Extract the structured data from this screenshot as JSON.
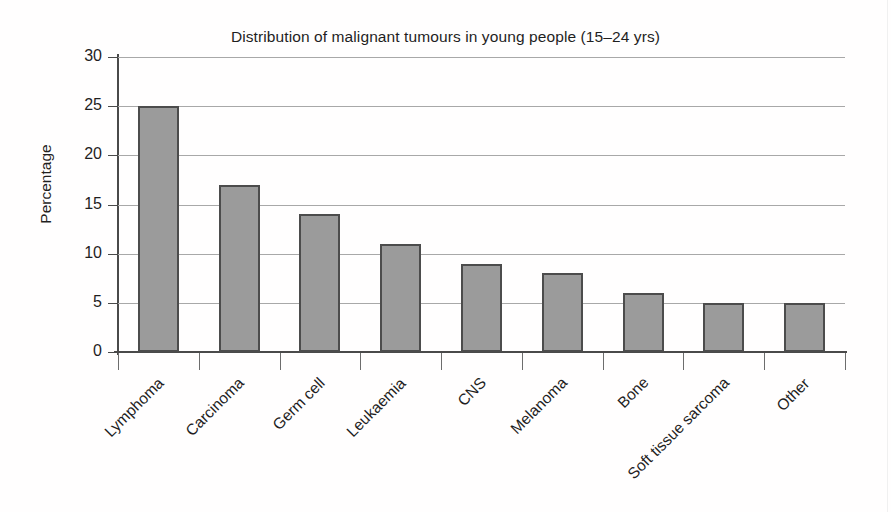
{
  "chart_data": {
    "type": "bar",
    "title": "Distribution of malignant tumours in young people (15–24 yrs)",
    "xlabel": "",
    "ylabel": "Percentage",
    "categories": [
      "Lymphoma",
      "Carcinoma",
      "Germ cell",
      "Leukaemia",
      "CNS",
      "Melanoma",
      "Bone",
      "Soft tissue sarcoma",
      "Other"
    ],
    "values": [
      25,
      17,
      14,
      11,
      9,
      8,
      6,
      5,
      5
    ],
    "ylim": [
      0,
      30
    ],
    "ytick_values": [
      0,
      5,
      10,
      15,
      20,
      25,
      30
    ],
    "ytick_labels": [
      "0",
      "5",
      "10",
      "15",
      "20",
      "25",
      "30"
    ],
    "grid": "horizontal",
    "legend": "none",
    "bar_fill_color": "#9b9b9b",
    "bar_edge_color": "#4c4c4c",
    "gridline_color": "#a8a8a8",
    "axis_color": "#4a4a4a",
    "background_color": "#fffefe",
    "text_color": "#1f1f1f",
    "category_label_rotation": -45
  }
}
